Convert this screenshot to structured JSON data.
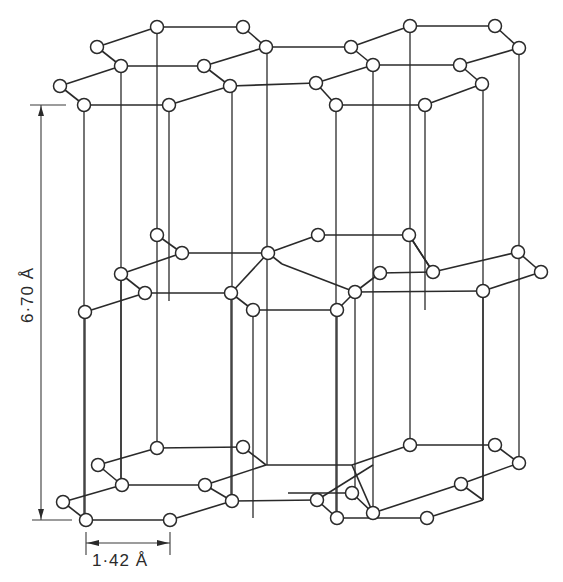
{
  "colors": {
    "line": "#2a2a2a",
    "atom_fill": "#ffffff",
    "background": "#ffffff"
  },
  "labels": {
    "interlayer_spacing": "6·70 Å",
    "bond_length": "1·42 Å"
  },
  "dimensions": {
    "vertical": {
      "x": 41,
      "y1": 105,
      "y2": 520,
      "tick1": [
        30,
        66
      ],
      "tick2": [
        32,
        72
      ]
    },
    "horizontal": {
      "y": 543,
      "x1": 86,
      "x2": 170,
      "ticks_y": [
        532,
        555
      ]
    }
  },
  "layers": [
    {
      "name": "top-layer",
      "atoms": [
        [
          157,
          27
        ],
        [
          243,
          27
        ],
        [
          97,
          47
        ],
        [
          121,
          66
        ],
        [
          204,
          66
        ],
        [
          266,
          47
        ],
        [
          60,
          86
        ],
        [
          84,
          105
        ],
        [
          169,
          105
        ],
        [
          230,
          86
        ],
        [
          410,
          26
        ],
        [
          495,
          26
        ],
        [
          351,
          47
        ],
        [
          373,
          65
        ],
        [
          460,
          65
        ],
        [
          519,
          48
        ],
        [
          316,
          83
        ],
        [
          336,
          105
        ],
        [
          425,
          105
        ],
        [
          482,
          84
        ]
      ],
      "bonds": [
        [
          [
            157,
            27
          ],
          [
            243,
            27
          ]
        ],
        [
          [
            97,
            47
          ],
          [
            157,
            27
          ]
        ],
        [
          [
            97,
            47
          ],
          [
            121,
            66
          ]
        ],
        [
          [
            121,
            66
          ],
          [
            204,
            66
          ]
        ],
        [
          [
            243,
            27
          ],
          [
            266,
            47
          ]
        ],
        [
          [
            204,
            66
          ],
          [
            266,
            47
          ]
        ],
        [
          [
            60,
            86
          ],
          [
            121,
            66
          ]
        ],
        [
          [
            60,
            86
          ],
          [
            84,
            105
          ]
        ],
        [
          [
            84,
            105
          ],
          [
            169,
            105
          ]
        ],
        [
          [
            204,
            66
          ],
          [
            230,
            86
          ]
        ],
        [
          [
            169,
            105
          ],
          [
            230,
            86
          ]
        ],
        [
          [
            266,
            47
          ],
          [
            351,
            47
          ]
        ],
        [
          [
            230,
            86
          ],
          [
            316,
            83
          ]
        ],
        [
          [
            410,
            26
          ],
          [
            495,
            26
          ]
        ],
        [
          [
            351,
            47
          ],
          [
            410,
            26
          ]
        ],
        [
          [
            351,
            47
          ],
          [
            373,
            65
          ]
        ],
        [
          [
            373,
            65
          ],
          [
            460,
            65
          ]
        ],
        [
          [
            495,
            26
          ],
          [
            519,
            48
          ]
        ],
        [
          [
            460,
            65
          ],
          [
            519,
            48
          ]
        ],
        [
          [
            316,
            83
          ],
          [
            373,
            65
          ]
        ],
        [
          [
            316,
            83
          ],
          [
            336,
            105
          ]
        ],
        [
          [
            336,
            105
          ],
          [
            425,
            105
          ]
        ],
        [
          [
            460,
            65
          ],
          [
            482,
            84
          ]
        ],
        [
          [
            425,
            105
          ],
          [
            482,
            84
          ]
        ]
      ]
    },
    {
      "name": "middle-layer",
      "atoms": [
        [
          157,
          235
        ],
        [
          182,
          253
        ],
        [
          121,
          274
        ],
        [
          145,
          293
        ],
        [
          85,
          312
        ],
        [
          231,
          293
        ],
        [
          268,
          253
        ],
        [
          253,
          310
        ],
        [
          318,
          235
        ],
        [
          409,
          235
        ],
        [
          433,
          272
        ],
        [
          380,
          273
        ],
        [
          355,
          292
        ],
        [
          337,
          310
        ],
        [
          483,
          291
        ],
        [
          518,
          252
        ],
        [
          541,
          272
        ]
      ],
      "bonds": [
        [
          [
            157,
            235
          ],
          [
            182,
            253
          ]
        ],
        [
          [
            121,
            274
          ],
          [
            182,
            253
          ]
        ],
        [
          [
            121,
            274
          ],
          [
            145,
            293
          ]
        ],
        [
          [
            85,
            312
          ],
          [
            145,
            293
          ]
        ],
        [
          [
            182,
            253
          ],
          [
            268,
            253
          ]
        ],
        [
          [
            145,
            293
          ],
          [
            231,
            293
          ]
        ],
        [
          [
            231,
            293
          ],
          [
            268,
            253
          ]
        ],
        [
          [
            231,
            293
          ],
          [
            253,
            310
          ]
        ],
        [
          [
            253,
            310
          ],
          [
            337,
            310
          ]
        ],
        [
          [
            268,
            253
          ],
          [
            318,
            235
          ]
        ],
        [
          [
            318,
            235
          ],
          [
            409,
            235
          ]
        ],
        [
          [
            268,
            253
          ],
          [
            282,
            264
          ]
        ],
        [
          [
            282,
            264
          ],
          [
            355,
            292
          ]
        ],
        [
          [
            409,
            235
          ],
          [
            433,
            272
          ]
        ],
        [
          [
            380,
            273
          ],
          [
            433,
            272
          ]
        ],
        [
          [
            355,
            292
          ],
          [
            380,
            273
          ]
        ],
        [
          [
            337,
            310
          ],
          [
            355,
            292
          ]
        ],
        [
          [
            409,
            235
          ],
          [
            433,
            272
          ]
        ],
        [
          [
            433,
            272
          ],
          [
            518,
            252
          ]
        ],
        [
          [
            355,
            292
          ],
          [
            483,
            291
          ]
        ],
        [
          [
            483,
            291
          ],
          [
            541,
            272
          ]
        ],
        [
          [
            518,
            252
          ],
          [
            541,
            272
          ]
        ]
      ]
    },
    {
      "name": "bottom-layer",
      "atoms": [
        [
          157,
          448
        ],
        [
          243,
          447
        ],
        [
          98,
          465
        ],
        [
          122,
          485
        ],
        [
          205,
          485
        ],
        [
          232,
          501
        ],
        [
          63,
          502
        ],
        [
          86,
          520
        ],
        [
          170,
          520
        ],
        [
          352,
          493
        ],
        [
          373,
          513
        ],
        [
          410,
          445
        ],
        [
          495,
          445
        ],
        [
          519,
          463
        ],
        [
          461,
          484
        ],
        [
          427,
          518
        ],
        [
          317,
          500
        ],
        [
          337,
          518
        ]
      ],
      "bonds": [
        [
          [
            157,
            448
          ],
          [
            243,
            447
          ]
        ],
        [
          [
            98,
            465
          ],
          [
            157,
            448
          ]
        ],
        [
          [
            98,
            465
          ],
          [
            122,
            485
          ]
        ],
        [
          [
            122,
            485
          ],
          [
            205,
            485
          ]
        ],
        [
          [
            243,
            447
          ],
          [
            266,
            465
          ]
        ],
        [
          [
            205,
            485
          ],
          [
            266,
            465
          ]
        ],
        [
          [
            63,
            502
          ],
          [
            122,
            485
          ]
        ],
        [
          [
            63,
            502
          ],
          [
            86,
            520
          ]
        ],
        [
          [
            86,
            520
          ],
          [
            170,
            520
          ]
        ],
        [
          [
            205,
            485
          ],
          [
            232,
            501
          ]
        ],
        [
          [
            170,
            520
          ],
          [
            232,
            501
          ]
        ],
        [
          [
            266,
            465
          ],
          [
            352,
            465
          ]
        ],
        [
          [
            232,
            501
          ],
          [
            317,
            500
          ]
        ],
        [
          [
            410,
            445
          ],
          [
            495,
            445
          ]
        ],
        [
          [
            352,
            465
          ],
          [
            410,
            445
          ]
        ],
        [
          [
            352,
            493
          ],
          [
            373,
            513
          ]
        ],
        [
          [
            373,
            513
          ],
          [
            461,
            484
          ]
        ],
        [
          [
            495,
            445
          ],
          [
            519,
            463
          ]
        ],
        [
          [
            461,
            484
          ],
          [
            519,
            463
          ]
        ],
        [
          [
            317,
            500
          ],
          [
            373,
            465
          ]
        ],
        [
          [
            317,
            500
          ],
          [
            337,
            518
          ]
        ],
        [
          [
            337,
            518
          ],
          [
            427,
            518
          ]
        ],
        [
          [
            461,
            484
          ],
          [
            483,
            500
          ]
        ],
        [
          [
            427,
            518
          ],
          [
            483,
            500
          ]
        ],
        [
          [
            352,
            465
          ],
          [
            373,
            513
          ]
        ],
        [
          [
            288,
            493
          ],
          [
            352,
            493
          ]
        ]
      ]
    }
  ],
  "verticals": [
    [
      84,
      105,
      520
    ],
    [
      121,
      66,
      485
    ],
    [
      157,
      27,
      235
    ],
    [
      157,
      235,
      448
    ],
    [
      169,
      105,
      301
    ],
    [
      232,
      86,
      501
    ],
    [
      267,
      47,
      253
    ],
    [
      267,
      253,
      465
    ],
    [
      231,
      293,
      501
    ],
    [
      336,
      105,
      518
    ],
    [
      373,
      65,
      513
    ],
    [
      410,
      26,
      235
    ],
    [
      410,
      235,
      445
    ],
    [
      425,
      105,
      310
    ],
    [
      483,
      84,
      500
    ],
    [
      519,
      48,
      252
    ],
    [
      519,
      252,
      463
    ],
    [
      85,
      312,
      520
    ],
    [
      121,
      274,
      485
    ],
    [
      253,
      310,
      518
    ],
    [
      337,
      310,
      518
    ],
    [
      355,
      292,
      500
    ],
    [
      483,
      291,
      500
    ]
  ]
}
